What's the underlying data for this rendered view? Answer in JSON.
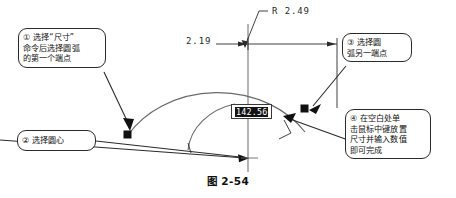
{
  "figure": {
    "caption": "图 2-54"
  },
  "callouts": [
    {
      "id": "callout-1",
      "marker": "①",
      "text": "① 选择“尺寸”\n命令后选择圆弧\n的第一个端点"
    },
    {
      "id": "callout-2",
      "marker": "②",
      "text": "② 选择圆心"
    },
    {
      "id": "callout-3",
      "marker": "③",
      "text": "③  选择圆\n弧另一端点"
    },
    {
      "id": "callout-4",
      "marker": "④",
      "text": "④  在空白处单\n击鼠标中键放置\n尺寸并输入数值\n即可完成"
    }
  ],
  "dimensions": {
    "radius_label": "R 2.49",
    "linear_label": "2.19",
    "editing_value": "142.56"
  },
  "colors": {
    "line": "#2b2b2b",
    "geometry": "#555555",
    "marker": "#101010",
    "highlight_bg": "#141414",
    "highlight_fg": "#ffffff",
    "background": "#ffffff"
  }
}
